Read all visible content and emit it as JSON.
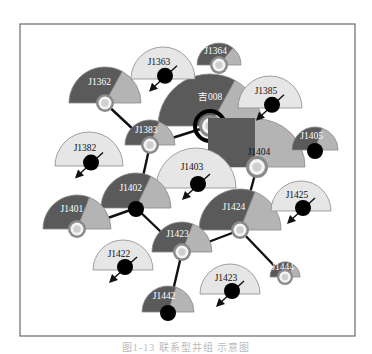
{
  "caption": "图1-13 联系型井组 示意图",
  "colors": {
    "dark": "#5a5a5a",
    "mid": "#b4b4b4",
    "light": "#e6e6e6",
    "edge": "#8a8a8a",
    "link": "#111111",
    "frame": "#6a6a6a",
    "label_on_dark": "#ffffff",
    "label_on_light": "#111111"
  },
  "frame": {
    "x": 20,
    "y": 24,
    "w": 335,
    "h": 312
  },
  "links": [
    {
      "from": "J1362",
      "to": "J1383"
    },
    {
      "from": "J1383",
      "to": "吉008"
    },
    {
      "from": "J1383",
      "to": "J1402"
    },
    {
      "from": "J1402",
      "to": "J1401"
    },
    {
      "from": "J1402",
      "to": "J1423a"
    },
    {
      "from": "J1423a",
      "to": "J1442"
    },
    {
      "from": "J1423a",
      "to": "J1424"
    },
    {
      "from": "J1424",
      "to": "J1404"
    },
    {
      "from": "J1424",
      "to": "J1444"
    }
  ],
  "wells": [
    {
      "id": "吉008",
      "label": "吉008",
      "type": "producer",
      "cx": 210,
      "cy": 126,
      "r": 52,
      "split": 0.66,
      "center": "injector-ring",
      "hub_bold": true
    },
    {
      "id": "J1404",
      "label": "J1404",
      "type": "light-big",
      "cx": 257,
      "cy": 167,
      "r": 48
    },
    {
      "id": "J1403",
      "label": "J1403",
      "type": "oil",
      "cx": 196,
      "cy": 188,
      "r": 40
    },
    {
      "id": "J1363",
      "label": "J1363",
      "type": "oil",
      "cx": 163,
      "cy": 79,
      "r": 32
    },
    {
      "id": "J1364",
      "label": "J1364",
      "type": "producer",
      "cx": 219,
      "cy": 65,
      "r": 22,
      "split": 0.72,
      "center": "injector"
    },
    {
      "id": "J1362",
      "label": "J1362",
      "type": "producer",
      "cx": 105,
      "cy": 103,
      "r": 36,
      "split": 0.66,
      "center": "injector"
    },
    {
      "id": "J1385",
      "label": "J1385",
      "type": "oil",
      "cx": 270,
      "cy": 108,
      "r": 32
    },
    {
      "id": "J1405",
      "label": "J1405",
      "type": "producer",
      "cx": 315,
      "cy": 150,
      "r": 23,
      "split": 0.6,
      "center": "oil"
    },
    {
      "id": "J1383",
      "label": "J1383",
      "type": "producer",
      "cx": 150,
      "cy": 145,
      "r": 25,
      "split": 0.62,
      "center": "injector"
    },
    {
      "id": "J1382",
      "label": "J1382",
      "type": "oil",
      "cx": 89,
      "cy": 166,
      "r": 34
    },
    {
      "id": "J1402",
      "label": "J1402",
      "type": "producer",
      "cx": 136,
      "cy": 208,
      "r": 35,
      "split": 0.64,
      "center": "oil"
    },
    {
      "id": "J1401",
      "label": "J1401",
      "type": "producer",
      "cx": 77,
      "cy": 229,
      "r": 34,
      "split": 0.62,
      "center": "injector"
    },
    {
      "id": "J1425",
      "label": "J1425",
      "type": "oil",
      "cx": 301,
      "cy": 211,
      "r": 30
    },
    {
      "id": "J1424",
      "label": "J1424",
      "type": "producer",
      "cx": 240,
      "cy": 230,
      "r": 41,
      "split": 0.62,
      "center": "injector"
    },
    {
      "id": "J1423a",
      "label": "J1423",
      "type": "producer",
      "cx": 182,
      "cy": 252,
      "r": 30,
      "split": 0.62,
      "center": "injector"
    },
    {
      "id": "J1422",
      "label": "J1422",
      "type": "oil",
      "cx": 123,
      "cy": 270,
      "r": 30
    },
    {
      "id": "J1444",
      "label": "J1444",
      "type": "producer-small",
      "cx": 285,
      "cy": 277,
      "r": 15,
      "split": 0.72,
      "center": "injector"
    },
    {
      "id": "J1423b",
      "label": "J1423",
      "type": "oil",
      "cx": 230,
      "cy": 294,
      "r": 30
    },
    {
      "id": "J1442",
      "label": "J1442",
      "type": "producer",
      "cx": 168,
      "cy": 312,
      "r": 26,
      "split": 0.6,
      "center": "oil"
    }
  ]
}
